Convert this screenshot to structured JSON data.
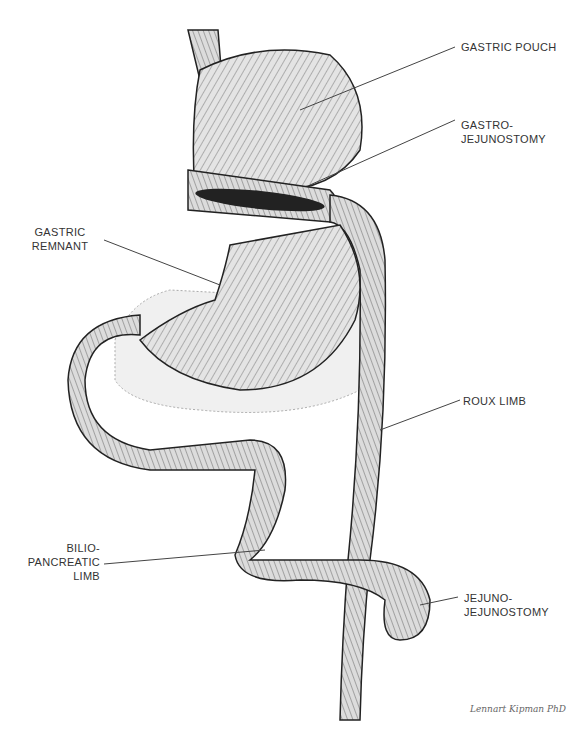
{
  "diagram": {
    "labels": {
      "gastric_pouch": "GASTRIC POUCH",
      "gastro_jejunostomy": "GASTRO-\nJEJUNOSTOMY",
      "gastric_remnant": "GASTRIC\nREMNANT",
      "roux_limb": "ROUX LIMB",
      "bilio_pancreatic_limb": "BILIO-\nPANCREATIC\nLIMB",
      "jejuno_jejunostomy": "JEJUNO-\nJEJUNOSTOMY"
    },
    "signature": "Lennart Kipman PhD",
    "colors": {
      "ink": "#222222",
      "tissue": "#d8d8d8",
      "label": "#333333",
      "leader": "#444444"
    }
  }
}
